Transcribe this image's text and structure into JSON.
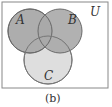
{
  "diagram": {
    "type": "venn",
    "universe_label": "U",
    "sets": [
      {
        "name": "A",
        "label": "A",
        "shaded": true
      },
      {
        "name": "B",
        "label": "B",
        "shaded": true
      },
      {
        "name": "C",
        "label": "C",
        "shaded": false
      }
    ],
    "shaded_regions": [
      "A",
      "B"
    ],
    "caption": "(b)",
    "colors": {
      "shaded": "#a9a9a9",
      "unshaded_circle": "#dedede",
      "outline": "#6a6a6a",
      "background": "#ffffff"
    }
  }
}
